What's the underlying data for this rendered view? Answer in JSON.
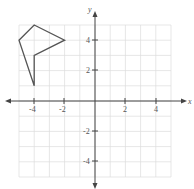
{
  "chart_data": {
    "type": "line",
    "title": "",
    "xlabel": "x",
    "ylabel": "y",
    "xlim": [
      -5,
      5
    ],
    "ylim": [
      -5,
      5
    ],
    "grid": true,
    "x_ticks": [
      "-4",
      "-2",
      "2",
      "4"
    ],
    "y_ticks": [
      "4",
      "2",
      "-2",
      "-4"
    ],
    "series": [
      {
        "name": "polygon",
        "closed": true,
        "points": [
          [
            -4,
            5
          ],
          [
            -2,
            4
          ],
          [
            -4,
            3
          ],
          [
            -4,
            1
          ],
          [
            -5,
            4
          ]
        ]
      }
    ]
  },
  "labels": {
    "x_axis": "x",
    "y_axis": "y",
    "xt_n4": "-4",
    "xt_n2": "-2",
    "xt_2": "2",
    "xt_4": "4",
    "yt_4": "4",
    "yt_2": "2",
    "yt_n2": "-2",
    "yt_n4": "-4"
  }
}
